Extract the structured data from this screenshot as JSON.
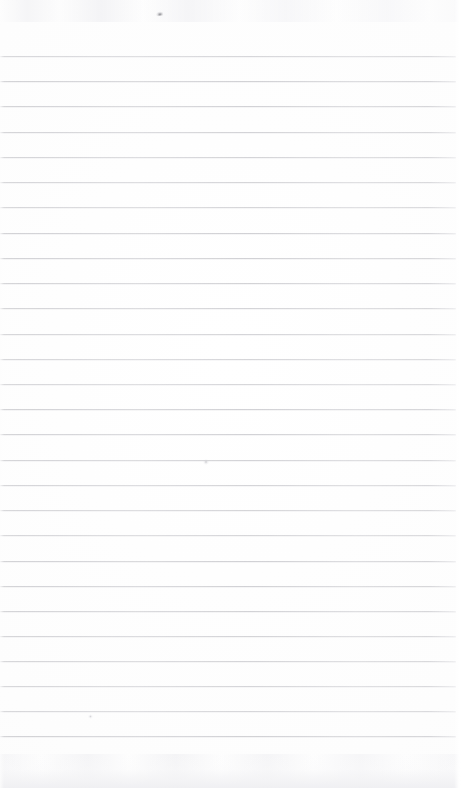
{
  "document": {
    "kind": "lined-notebook-page",
    "title": "",
    "body_text": "",
    "page_number": "",
    "header_text": "",
    "footer_text": ""
  },
  "paper": {
    "background_color": "#fefefe",
    "rule_color": "#cdcdd1",
    "rule_count": 28,
    "first_rule_y": 56,
    "rule_spacing": 25.2,
    "rule_thickness": 1,
    "rule_left_x": 0,
    "rule_right_x": 456,
    "margin_line": "none",
    "top_margin_height": 56,
    "bottom_margin_height": 52
  },
  "marks": [
    {
      "name": "pencil-smudge-top",
      "x": 155,
      "y": 11,
      "label": ""
    },
    {
      "name": "pencil-speck-middle",
      "x": 203,
      "y": 459,
      "label": ""
    },
    {
      "name": "pencil-speck-lower-left",
      "x": 88,
      "y": 714,
      "label": ""
    }
  ],
  "rules": [
    {
      "y": 56
    },
    {
      "y": 81
    },
    {
      "y": 106
    },
    {
      "y": 132
    },
    {
      "y": 157
    },
    {
      "y": 182
    },
    {
      "y": 207
    },
    {
      "y": 233
    },
    {
      "y": 258
    },
    {
      "y": 283
    },
    {
      "y": 308
    },
    {
      "y": 334
    },
    {
      "y": 359
    },
    {
      "y": 384
    },
    {
      "y": 409
    },
    {
      "y": 434
    },
    {
      "y": 460
    },
    {
      "y": 485
    },
    {
      "y": 510
    },
    {
      "y": 535
    },
    {
      "y": 561
    },
    {
      "y": 586
    },
    {
      "y": 611
    },
    {
      "y": 636
    },
    {
      "y": 661
    },
    {
      "y": 686
    },
    {
      "y": 711
    },
    {
      "y": 736
    }
  ]
}
